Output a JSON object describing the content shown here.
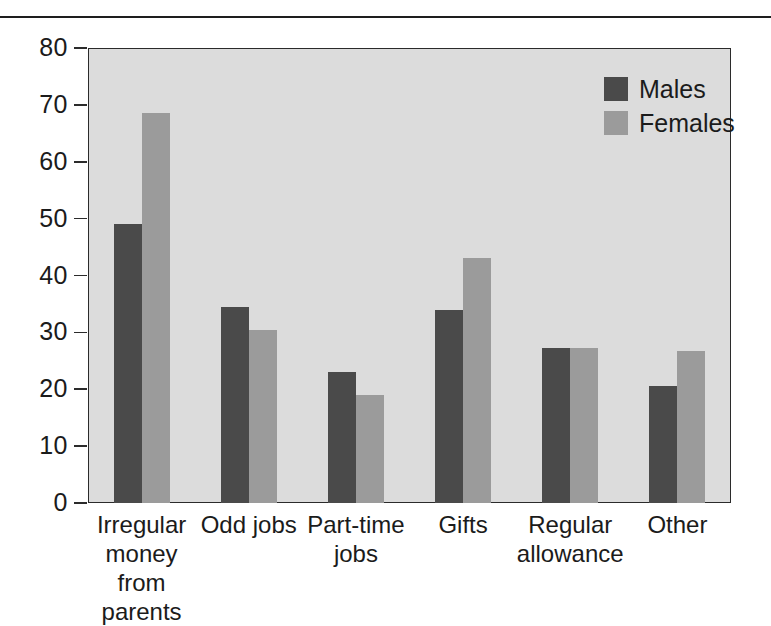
{
  "chart_data": {
    "type": "bar",
    "title": "",
    "xlabel": "",
    "ylabel": "",
    "ylim": [
      0,
      80
    ],
    "yticks": [
      0,
      10,
      20,
      30,
      40,
      50,
      60,
      70,
      80
    ],
    "ytick_labels": [
      "0",
      "10",
      "20",
      "30",
      "40",
      "50",
      "60",
      "70",
      "80"
    ],
    "grid": false,
    "legend_position": "top-right",
    "categories": [
      "Irregular money from parents",
      "Odd jobs",
      "Part-time jobs",
      "Gifts",
      "Regular allowance",
      "Other"
    ],
    "category_lines": [
      [
        "Irregular",
        "money from",
        "parents"
      ],
      [
        "Odd jobs"
      ],
      [
        "Part-time",
        "jobs"
      ],
      [
        "Gifts"
      ],
      [
        "Regular",
        "allowance"
      ],
      [
        "Other"
      ]
    ],
    "series": [
      {
        "name": "Males",
        "color": "#4a4a4a",
        "values": [
          49,
          34.5,
          23,
          34,
          27.3,
          20.5
        ]
      },
      {
        "name": "Females",
        "color": "#9b9b9b",
        "values": [
          68.5,
          30.5,
          19,
          43,
          27.3,
          26.8
        ]
      }
    ]
  },
  "legend": {
    "items": [
      {
        "label": "Males",
        "color": "#4a4a4a"
      },
      {
        "label": "Females",
        "color": "#9b9b9b"
      }
    ]
  },
  "colors": {
    "males": "#4a4a4a",
    "females": "#9b9b9b",
    "plot_background": "#dcdcdc",
    "axis": "#2b2b2b",
    "text": "#1b1b1b",
    "page_background": "#ffffff"
  }
}
